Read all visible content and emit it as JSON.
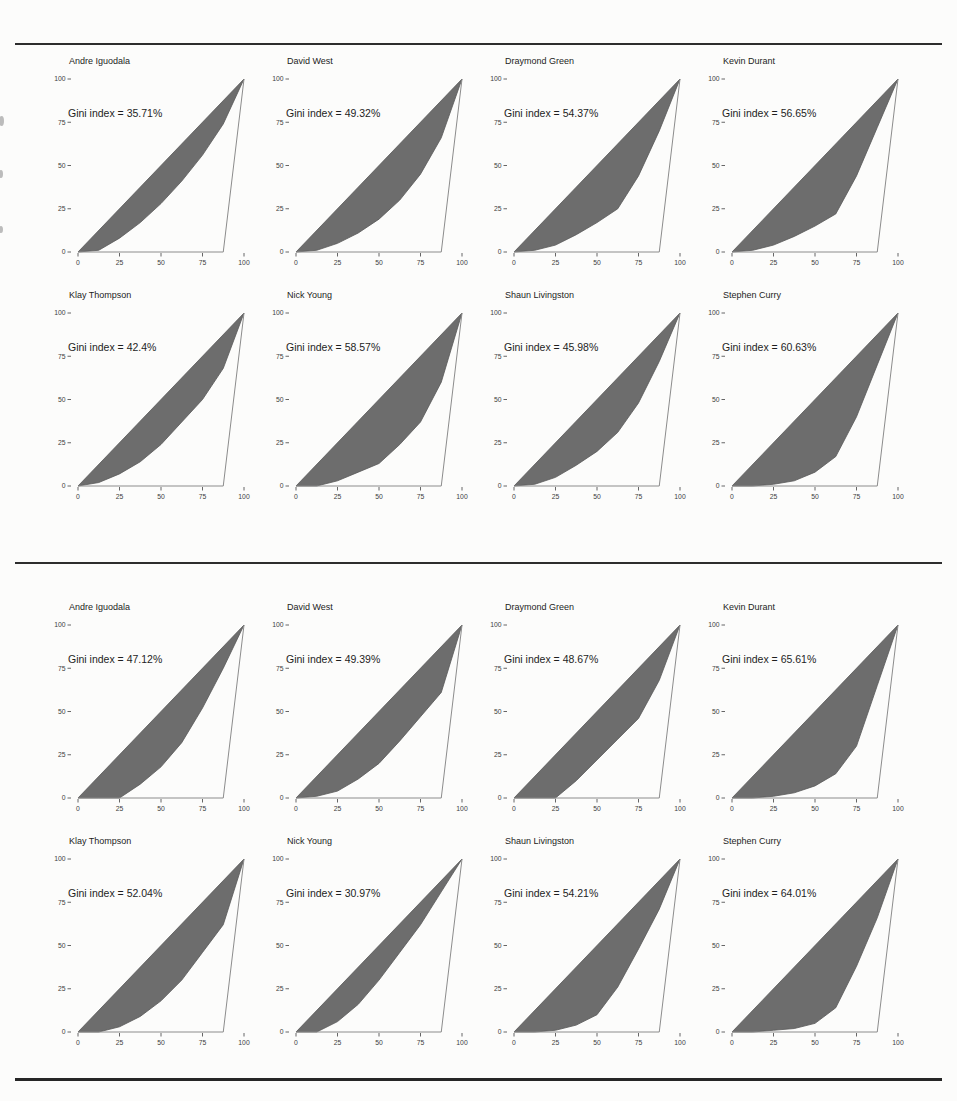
{
  "page": {
    "background": "#fcfcfb",
    "rule_color": "#2d2d2d",
    "lorenz_fill_color": "#6d6d6d",
    "lorenz_edge_color": "#585858",
    "max_inequality_line_color": "#8c8c8c",
    "tick_color": "#555555"
  },
  "chart_data": [
    {
      "type": "area",
      "figure": "lorenz-gini-grid-top",
      "x": [
        0,
        12.5,
        25,
        37.5,
        50,
        62.5,
        75,
        87.5,
        100
      ],
      "x_ticks": [
        0,
        25,
        50,
        75,
        100
      ],
      "y_ticks": [
        0,
        25,
        50,
        75,
        100
      ],
      "xlim": [
        0,
        100
      ],
      "ylim": [
        0,
        100
      ],
      "equality_line": [
        [
          0,
          0
        ],
        [
          100,
          100
        ]
      ],
      "max_inequality_line": [
        [
          0,
          0
        ],
        [
          87.5,
          0
        ],
        [
          100,
          100
        ]
      ],
      "legend": "none",
      "grid": "off",
      "plots": [
        {
          "player": "Andre Iguodala",
          "gini_label": "Gini index = 35.71%",
          "gini_percent": 35.71,
          "lorenz_y": [
            0,
            1,
            8,
            17,
            28,
            41,
            56,
            74,
            100
          ]
        },
        {
          "player": "David West",
          "gini_label": "Gini index = 49.32%",
          "gini_percent": 49.32,
          "lorenz_y": [
            0,
            1,
            5,
            11,
            19,
            30,
            45,
            66,
            100
          ]
        },
        {
          "player": "Draymond Green",
          "gini_label": "Gini index = 54.37%",
          "gini_percent": 54.37,
          "lorenz_y": [
            0,
            1,
            4,
            10,
            17,
            25,
            44,
            70,
            100
          ]
        },
        {
          "player": "Kevin Durant",
          "gini_label": "Gini index = 56.65%",
          "gini_percent": 56.65,
          "lorenz_y": [
            0,
            1,
            4,
            9,
            15,
            22,
            44,
            72,
            100
          ]
        },
        {
          "player": "Klay Thompson",
          "gini_label": "Gini index = 42.4%",
          "gini_percent": 42.4,
          "lorenz_y": [
            0,
            2,
            7,
            14,
            24,
            37,
            50,
            68,
            100
          ]
        },
        {
          "player": "Nick Young",
          "gini_label": "Gini index = 58.57%",
          "gini_percent": 58.57,
          "lorenz_y": [
            0,
            0,
            3,
            8,
            13,
            24,
            37,
            60,
            100
          ]
        },
        {
          "player": "Shaun Livingston",
          "gini_label": "Gini index = 45.98%",
          "gini_percent": 45.98,
          "lorenz_y": [
            0,
            1,
            5,
            12,
            20,
            31,
            48,
            72,
            100
          ]
        },
        {
          "player": "Stephen Curry",
          "gini_label": "Gini index = 60.63%",
          "gini_percent": 60.63,
          "lorenz_y": [
            0,
            0,
            1,
            3,
            8,
            17,
            40,
            70,
            100
          ]
        }
      ]
    },
    {
      "type": "area",
      "figure": "lorenz-gini-grid-bottom",
      "x": [
        0,
        12.5,
        25,
        37.5,
        50,
        62.5,
        75,
        87.5,
        100
      ],
      "x_ticks": [
        0,
        25,
        50,
        75,
        100
      ],
      "y_ticks": [
        0,
        25,
        50,
        75,
        100
      ],
      "xlim": [
        0,
        100
      ],
      "ylim": [
        0,
        100
      ],
      "equality_line": [
        [
          0,
          0
        ],
        [
          100,
          100
        ]
      ],
      "max_inequality_line": [
        [
          0,
          0
        ],
        [
          87.5,
          0
        ],
        [
          100,
          100
        ]
      ],
      "legend": "none",
      "grid": "off",
      "plots": [
        {
          "player": "Andre Iguodala",
          "gini_label": "Gini index = 47.12%",
          "gini_percent": 47.12,
          "lorenz_y": [
            0,
            0,
            0,
            8,
            18,
            32,
            52,
            75,
            100
          ]
        },
        {
          "player": "David West",
          "gini_label": "Gini index = 49.39%",
          "gini_percent": 49.39,
          "lorenz_y": [
            0,
            1,
            4,
            11,
            20,
            33,
            47,
            61,
            100
          ]
        },
        {
          "player": "Draymond Green",
          "gini_label": "Gini index = 48.67%",
          "gini_percent": 48.67,
          "lorenz_y": [
            0,
            0,
            0,
            10,
            22,
            34,
            46,
            68,
            100
          ]
        },
        {
          "player": "Kevin Durant",
          "gini_label": "Gini index = 65.61%",
          "gini_percent": 65.61,
          "lorenz_y": [
            0,
            0,
            1,
            3,
            7,
            14,
            30,
            65,
            100
          ]
        },
        {
          "player": "Klay Thompson",
          "gini_label": "Gini index = 52.04%",
          "gini_percent": 52.04,
          "lorenz_y": [
            0,
            0,
            3,
            9,
            18,
            30,
            46,
            62,
            100
          ]
        },
        {
          "player": "Nick Young",
          "gini_label": "Gini index = 30.97%",
          "gini_percent": 30.97,
          "lorenz_y": [
            0,
            0,
            6,
            16,
            30,
            46,
            62,
            81,
            100
          ]
        },
        {
          "player": "Shaun Livingston",
          "gini_label": "Gini index = 54.21%",
          "gini_percent": 54.21,
          "lorenz_y": [
            0,
            0,
            1,
            4,
            10,
            26,
            48,
            71,
            100
          ]
        },
        {
          "player": "Stephen Curry",
          "gini_label": "Gini index = 64.01%",
          "gini_percent": 64.01,
          "lorenz_y": [
            0,
            0,
            1,
            2,
            5,
            14,
            38,
            66,
            100
          ]
        }
      ]
    }
  ]
}
